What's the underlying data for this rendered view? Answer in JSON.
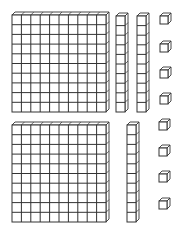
{
  "diagram": {
    "stroke_color": "#333333",
    "face_color": "#ffffff",
    "depth": 3,
    "groups": [
      {
        "name": "top-group",
        "hundreds": [
          {
            "x": 12,
            "y": 15,
            "w": 94,
            "h": 97,
            "cols": 10,
            "rows": 10
          }
        ],
        "tens": [
          {
            "x": 116,
            "y": 16,
            "w": 9,
            "h": 96,
            "rows": 10
          },
          {
            "x": 137,
            "y": 16,
            "w": 9,
            "h": 96,
            "rows": 10
          }
        ],
        "ones": [
          {
            "x": 160,
            "y": 16,
            "s": 8
          },
          {
            "x": 160,
            "y": 44,
            "s": 8
          },
          {
            "x": 160,
            "y": 70,
            "s": 8
          },
          {
            "x": 160,
            "y": 96,
            "s": 8
          }
        ]
      },
      {
        "name": "bottom-group",
        "hundreds": [
          {
            "x": 12,
            "y": 125,
            "w": 94,
            "h": 97,
            "cols": 10,
            "rows": 10
          }
        ],
        "tens": [
          {
            "x": 127,
            "y": 125,
            "w": 9,
            "h": 97,
            "rows": 10
          }
        ],
        "ones": [
          {
            "x": 159,
            "y": 122,
            "s": 8
          },
          {
            "x": 159,
            "y": 148,
            "s": 8
          },
          {
            "x": 159,
            "y": 174,
            "s": 8
          },
          {
            "x": 159,
            "y": 201,
            "s": 8
          }
        ]
      }
    ]
  }
}
